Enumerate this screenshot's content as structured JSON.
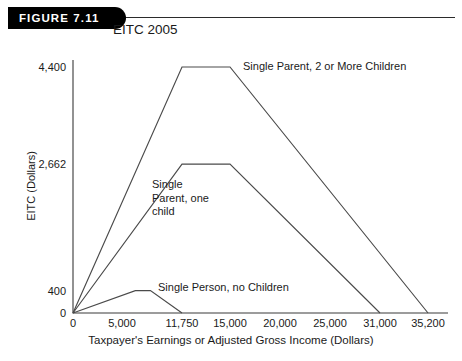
{
  "figure": {
    "badge_label": "FIGURE 7.11",
    "title": "EITC 2005"
  },
  "chart_data": {
    "type": "line",
    "title": "EITC 2005",
    "xlabel": "Taxpayer's Earnings or Adjusted Gross Income (Dollars)",
    "ylabel": "EITC (Dollars)",
    "grid": false,
    "legend_position": "inline-annotations",
    "xlim": [
      0,
      35200
    ],
    "ylim": [
      0,
      4400
    ],
    "xticks": [
      0,
      5000,
      11750,
      15000,
      20000,
      25000,
      31000,
      35200
    ],
    "xtick_labels": [
      "0",
      "5,000",
      "11,750",
      "15,000",
      "20,000",
      "25,000",
      "31,000",
      "35,200"
    ],
    "yticks": [
      0,
      400,
      2662,
      4400
    ],
    "ytick_labels": [
      "0",
      "400",
      "2,662",
      "4,400"
    ],
    "series": [
      {
        "name": "Single Parent, 2 or More Children",
        "x": [
          0,
          11750,
          15000,
          35200
        ],
        "y": [
          0,
          4400,
          4400,
          0
        ]
      },
      {
        "name": "Single Parent, one child",
        "x": [
          0,
          11750,
          15000,
          31000
        ],
        "y": [
          0,
          2662,
          2662,
          0
        ]
      },
      {
        "name": "Single Person, no Children",
        "x": [
          0,
          6500,
          8200,
          11750
        ],
        "y": [
          0,
          400,
          400,
          0
        ]
      }
    ],
    "annotations": [
      {
        "text": "Single Parent, 2 or More Children",
        "x": 243,
        "y": 60
      },
      {
        "text": "Single\nParent, one\nchild",
        "x": 152,
        "y": 178
      },
      {
        "text": "Single Person, no Children",
        "x": 158,
        "y": 281
      }
    ]
  }
}
